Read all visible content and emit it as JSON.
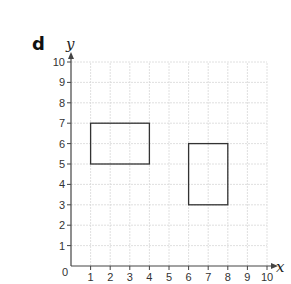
{
  "part_label": "d",
  "axes": {
    "x_label": "x",
    "y_label": "y",
    "x_ticks": [
      "0",
      "1",
      "2",
      "3",
      "4",
      "5",
      "6",
      "7",
      "8",
      "9",
      "10"
    ],
    "y_ticks": [
      "1",
      "2",
      "3",
      "4",
      "5",
      "6",
      "7",
      "8",
      "9",
      "10"
    ],
    "origin_label": "0"
  },
  "chart_data": {
    "type": "diagram",
    "title": "",
    "xlabel": "x",
    "ylabel": "y",
    "xlim": [
      0,
      10
    ],
    "ylim": [
      0,
      10
    ],
    "grid": true,
    "shapes": [
      {
        "name": "rectangle-A",
        "type": "rectangle",
        "x1": 1,
        "y1": 5,
        "x2": 4,
        "y2": 7,
        "vertices": [
          [
            1,
            5
          ],
          [
            4,
            5
          ],
          [
            4,
            7
          ],
          [
            1,
            7
          ]
        ]
      },
      {
        "name": "rectangle-B",
        "type": "rectangle",
        "x1": 6,
        "y1": 3,
        "x2": 8,
        "y2": 6,
        "vertices": [
          [
            6,
            3
          ],
          [
            8,
            3
          ],
          [
            8,
            6
          ],
          [
            6,
            6
          ]
        ]
      }
    ]
  },
  "colors": {
    "grid": "#d8d8d8",
    "axis": "#444444",
    "shape": "#333333"
  }
}
